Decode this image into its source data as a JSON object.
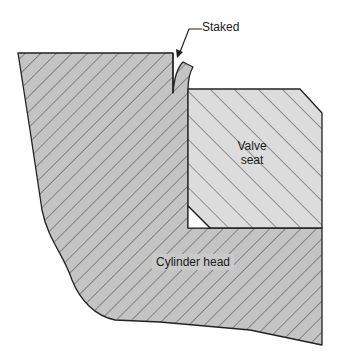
{
  "diagram": {
    "type": "cross-section",
    "labels": {
      "staked": "Staked",
      "valve_seat_line1": "Valve",
      "valve_seat_line2": "seat",
      "cylinder_head": "Cylinder head"
    },
    "components": [
      {
        "name": "Cylinder head",
        "fill": "#c4c4c4",
        "hatch": "diagonal down-right"
      },
      {
        "name": "Valve seat",
        "fill": "#dcdcdc",
        "hatch": "diagonal up-right"
      }
    ],
    "colors": {
      "background": "#ffffff",
      "head_fill": "#c4c4c4",
      "seat_fill": "#dcdcdc",
      "outline": "#222222",
      "hatch": "#333333"
    }
  }
}
